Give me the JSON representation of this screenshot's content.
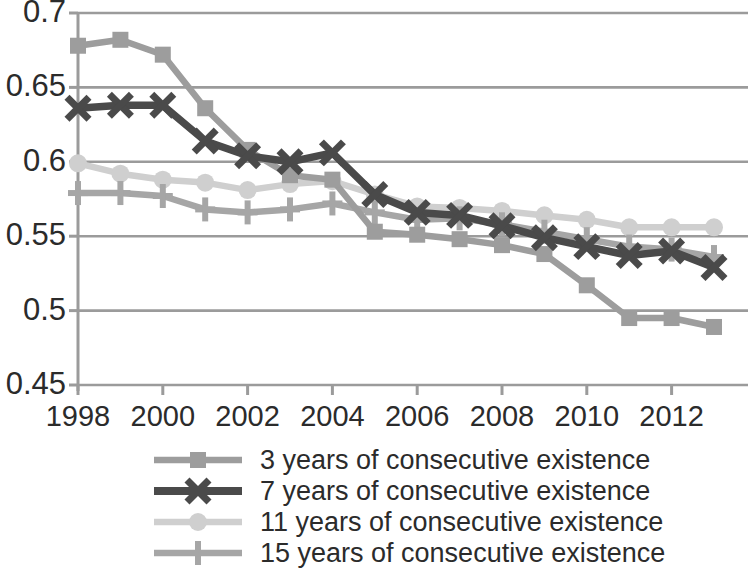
{
  "chart_data": {
    "type": "line",
    "title": "",
    "subtitle": "",
    "xlabel": "",
    "ylabel": "",
    "xlim": [
      1998,
      2013
    ],
    "ylim": [
      0.45,
      0.7
    ],
    "grid": true,
    "legend_position": "bottom",
    "x": [
      1998,
      1999,
      2000,
      2001,
      2002,
      2003,
      2004,
      2005,
      2006,
      2007,
      2008,
      2009,
      2010,
      2011,
      2012,
      2013
    ],
    "x_tick_labels": [
      "1998",
      "2000",
      "2002",
      "2004",
      "2006",
      "2008",
      "2010",
      "2012"
    ],
    "x_ticks": [
      1998,
      2000,
      2002,
      2004,
      2006,
      2008,
      2010,
      2012
    ],
    "y_tick_labels": [
      "0.7",
      "0.65",
      "0.6",
      "0.55",
      "0.5",
      "0.45"
    ],
    "y_ticks": [
      0.7,
      0.65,
      0.6,
      0.55,
      0.5,
      0.45
    ],
    "series": [
      {
        "name": "3 years of consecutive existence",
        "marker": "square",
        "color": "#9d9d9d",
        "values": [
          0.678,
          0.682,
          0.672,
          0.636,
          0.608,
          0.591,
          0.588,
          0.553,
          0.551,
          0.548,
          0.544,
          0.538,
          0.517,
          0.495,
          0.495,
          0.489
        ]
      },
      {
        "name": "7 years of consecutive existence",
        "marker": "x",
        "color": "#4a4a4a",
        "values": [
          0.636,
          0.638,
          0.638,
          0.614,
          0.604,
          0.6,
          0.606,
          0.578,
          0.566,
          0.564,
          0.557,
          0.549,
          0.543,
          0.537,
          0.54,
          0.529
        ]
      },
      {
        "name": "11 years of consecutive existence",
        "marker": "circle",
        "color": "#cfcfcf",
        "values": [
          0.599,
          0.592,
          0.588,
          0.586,
          0.581,
          0.585,
          0.587,
          0.578,
          0.57,
          0.569,
          0.567,
          0.564,
          0.561,
          0.556,
          0.556,
          0.556
        ]
      },
      {
        "name": "15 years of consecutive existence",
        "marker": "plus",
        "color": "#a6a6a6",
        "values": [
          0.579,
          0.579,
          0.577,
          0.568,
          0.566,
          0.568,
          0.572,
          0.566,
          0.561,
          0.562,
          0.558,
          0.553,
          0.548,
          0.543,
          0.541,
          0.536
        ]
      }
    ]
  },
  "axes": {
    "y_labels": [
      "0.7",
      "0.65",
      "0.6",
      "0.55",
      "0.5",
      "0.45"
    ],
    "x_labels": [
      "1998",
      "2000",
      "2002",
      "2004",
      "2006",
      "2008",
      "2010",
      "2012"
    ],
    "axis_color": "#9b9b9b"
  },
  "legend": {
    "items": [
      {
        "label": "3 years of consecutive existence",
        "marker": "square-marker",
        "color": "#9d9d9d"
      },
      {
        "label": "7 years of consecutive existence",
        "marker": "x-marker",
        "color": "#4a4a4a"
      },
      {
        "label": "11 years of consecutive existence",
        "marker": "circle-marker",
        "color": "#cfcfcf"
      },
      {
        "label": "15 years of consecutive existence",
        "marker": "plus-marker",
        "color": "#a6a6a6"
      }
    ]
  }
}
